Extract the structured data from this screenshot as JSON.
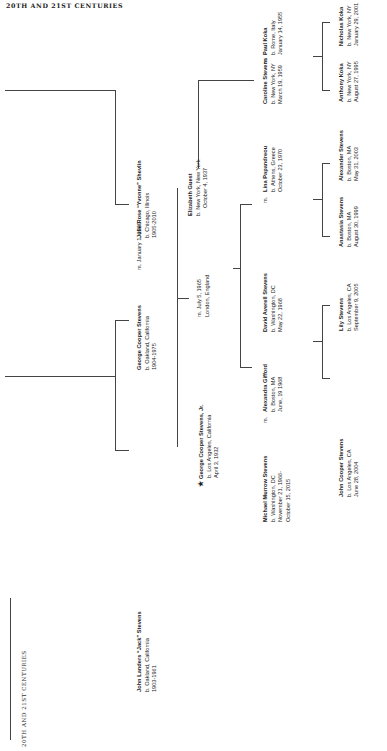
{
  "page": {
    "running_head": "20TH AND 21ST CENTURIES",
    "side_head": "20TH AND 21ST CENTURIES"
  },
  "generation1": {
    "john_landers": {
      "name": "John Landers “Jack” Stevens",
      "birth": "b. Oakland, California",
      "dates": "1903-1961"
    },
    "george_cooper": {
      "name": "George Cooper Stevens",
      "birth": "b. Oakland, California",
      "dates": "1904-1975"
    },
    "marriage": "m. January 1, 1930",
    "julie_rose": {
      "name": "Julie Rose “Yvonne” Shevlin",
      "birth": "b. Chicago, Illinois",
      "dates": "1905-2010"
    }
  },
  "generation2": {
    "george_jr": {
      "star": "★",
      "name": "George Cooper Stevens, Jr.",
      "birth": "b. Los Angeles, California",
      "dates": "April 3, 1932"
    },
    "marriage": {
      "date": "m. July 5, 1965",
      "place": "London, England"
    },
    "elizabeth": {
      "name": "Elizabeth Guest",
      "birth": "b. New York, New York",
      "dates": "October 4, 1937"
    }
  },
  "generation3": {
    "michael": {
      "name": "Michael Murrow Stevens",
      "birth": "b. Washington, DC",
      "dates1": "November 21, 1966-",
      "dates2": "October 15, 2015"
    },
    "michael_m": "m.",
    "alexandra": {
      "name": "Alexandra Gifford",
      "birth": "b. Boston, MA",
      "dates": "June, 19 1968"
    },
    "david": {
      "name": "David Averell Stevens",
      "birth": "b. Washington, DC",
      "dates": "May 22, 1968"
    },
    "david_m": "m.",
    "lina": {
      "name": "Lina Papandreou",
      "birth": "b. Athens, Greece",
      "dates": "October 23, 1970"
    },
    "caroline": {
      "name": "Caroline Stevens",
      "birth": "b. New York, NY",
      "dates": "March 19, 1959"
    },
    "caroline_m": "m.",
    "paul": {
      "name": "Paul Koka",
      "birth": "b. Rome, Italy",
      "dates": "January 14, 1955"
    }
  },
  "generation4": {
    "john_cooper": {
      "name": "John Cooper Stevens",
      "birth": "b. Los Angeles, CA",
      "dates": "June 28, 2004"
    },
    "lily": {
      "name": "Lily Stevens",
      "birth": "b. Los Angeles, CA",
      "dates": "September 9, 2005"
    },
    "anastasia": {
      "name": "Anastasia Stevens",
      "birth": "b. Boston, MA",
      "dates": "August 30, 1999"
    },
    "alexander": {
      "name": "Alexander Stevens",
      "birth": "b. Boston, MA",
      "dates": "May 31, 2003"
    },
    "anthony": {
      "name": "Anthony Koka",
      "birth": "b. New York, NY",
      "dates": "August 27, 1995"
    },
    "nicholas": {
      "name": "Nicholas Koka",
      "birth": "b. New York, NY",
      "dates": "January 29, 2001"
    }
  }
}
